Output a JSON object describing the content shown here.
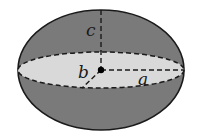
{
  "diagram": {
    "labels": {
      "a": "a",
      "b": "b",
      "c": "c"
    },
    "colors": {
      "body": "#7a7a7a",
      "equatorial_section": "#d9d9d9",
      "outline": "#1a1a1a",
      "background": "#ffffff"
    }
  }
}
